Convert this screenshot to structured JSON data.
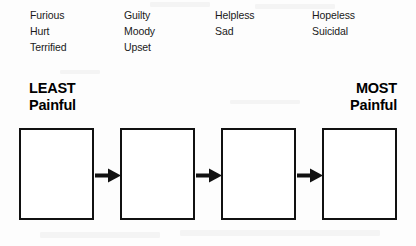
{
  "worksheet": {
    "columns": [
      {
        "name": "column-1",
        "words": [
          "Furious",
          "Hurt",
          "Terrified"
        ]
      },
      {
        "name": "column-2",
        "words": [
          "Guilty",
          "Moody",
          "Upset"
        ]
      },
      {
        "name": "column-3",
        "words": [
          "Helpless",
          "Sad"
        ]
      },
      {
        "name": "column-4",
        "words": [
          "Hopeless",
          "Suicidal"
        ]
      }
    ],
    "headings": {
      "least": {
        "line1": "LEAST",
        "line2": "Painful"
      },
      "most": {
        "line1": "MOST",
        "line2": "Painful"
      }
    },
    "boxes": [
      {
        "label": "",
        "name": "box-1"
      },
      {
        "label": "",
        "name": "box-2"
      },
      {
        "label": "",
        "name": "box-3"
      },
      {
        "label": "",
        "name": "box-4"
      }
    ],
    "arrows": [
      {
        "name": "arrow-1",
        "glyph": "right-arrow"
      },
      {
        "name": "arrow-2",
        "glyph": "right-arrow"
      },
      {
        "name": "arrow-3",
        "glyph": "right-arrow"
      }
    ],
    "colors": {
      "ink": "#111111",
      "paper": "#fdfdfd",
      "text": "#1a1a1a"
    }
  }
}
